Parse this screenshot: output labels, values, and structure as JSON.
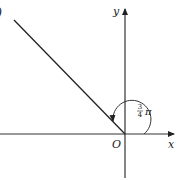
{
  "diagram": {
    "type": "angle-on-coordinate-plane",
    "axes": {
      "x_label": "x",
      "y_label": "y",
      "origin_label": "O"
    },
    "angle": {
      "label_num": "3",
      "label_den": "4",
      "label_pi": "π",
      "value": "3/4 π",
      "direction": "counterclockwise"
    },
    "corner_mark": ")"
  }
}
